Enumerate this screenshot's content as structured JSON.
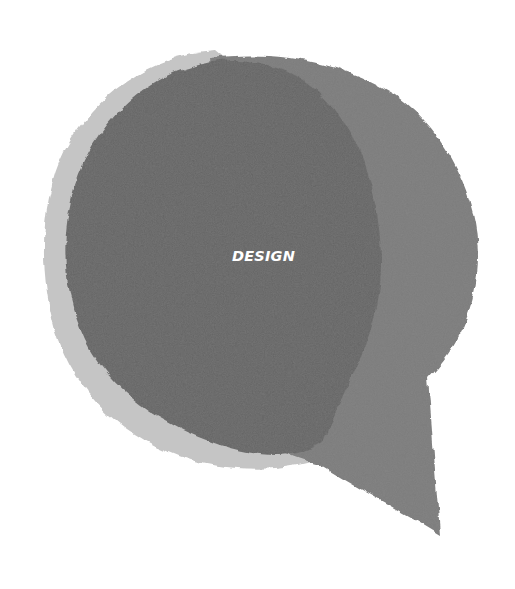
{
  "illustration": {
    "type": "torn-paper speech bubble",
    "text": "DESIGN",
    "colors": {
      "background": "#ffffff",
      "outer_ring": "#c4c4c4",
      "bubble_with_tail": "#7d7d7d",
      "inner_circle": "#666666",
      "text": "#ffffff"
    }
  }
}
